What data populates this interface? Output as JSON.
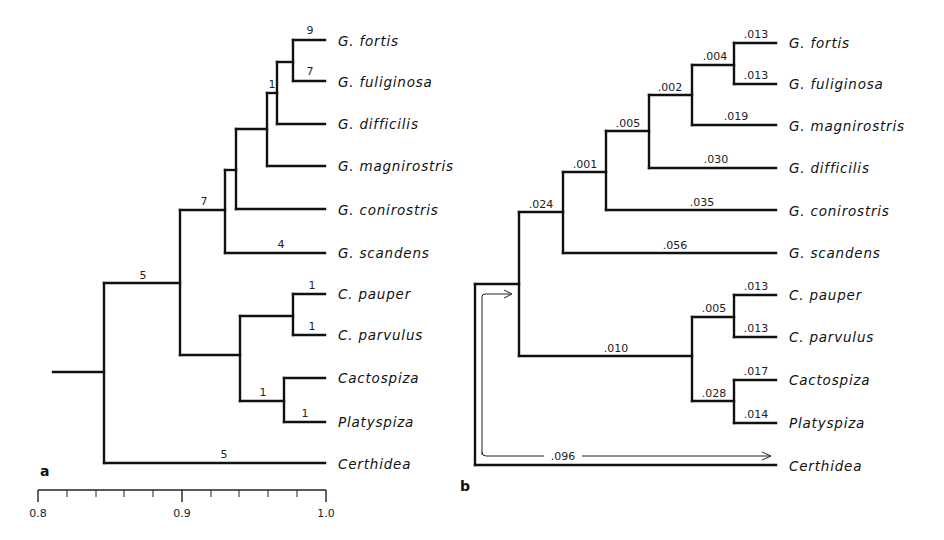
{
  "panel_a": {
    "label": "a",
    "taxa": [
      "G. fortis",
      "G. fuliginosa",
      "G. difficilis",
      "G. magnirostris",
      "G. conirostris",
      "G. scandens",
      "C. pauper",
      "C. parvulus",
      "Cactospiza",
      "Platyspiza",
      "Certhidea"
    ],
    "branch_labels": {
      "fortis": "9",
      "fuliginosa": "7",
      "inner_node": "1",
      "g_clade": "7",
      "scandens": "4",
      "root_upper": "5",
      "pauper": "1",
      "parvulus": "1",
      "cacto_platy": "1",
      "platyspiza": "1",
      "certhidea": "5"
    },
    "axis": {
      "ticks": [
        "0.8",
        "0.9",
        "1.0"
      ],
      "range": [
        0.8,
        1.0
      ],
      "minor_step": 0.02
    }
  },
  "panel_b": {
    "label": "b",
    "taxa": [
      "G. fortis",
      "G. fuliginosa",
      "G. magnirostris",
      "G. difficilis",
      "G. conirostris",
      "G. scandens",
      "C. pauper",
      "C. parvulus",
      "Cactospiza",
      "Platyspiza",
      "Certhidea"
    ],
    "branch_lengths": {
      "fortis": ".013",
      "fuliginosa": ".013",
      "fort_fulig_stem": ".004",
      "magn_stem": ".002",
      "magnirostris": ".019",
      "diff_stem": ".005",
      "difficilis": ".030",
      "coni_stem": ".001",
      "conirostris": ".035",
      "g_stem": ".024",
      "scandens": ".056",
      "pauper": ".013",
      "parvulus": ".013",
      "camarhynchus_stem": ".005",
      "tree_finch_stem": ".010",
      "cacto_platy_stem": ".028",
      "cactospiza": ".017",
      "platyspiza": ".014",
      "certhidea": ".096"
    }
  }
}
